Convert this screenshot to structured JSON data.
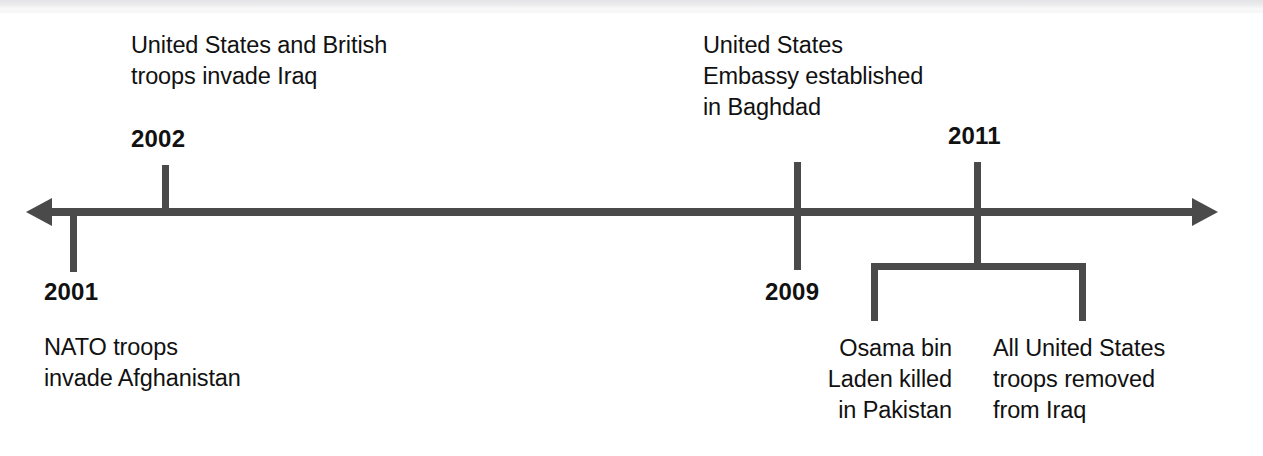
{
  "figure": {
    "kind": "historical-timeline",
    "orientation": "horizontal",
    "line_color": "#4a4a4a",
    "text_color": "#111111",
    "background": "#ffffff",
    "left_arrowhead": "arrow-left-icon",
    "right_arrowhead": "arrow-right-icon"
  },
  "events": [
    {
      "id": "e2001",
      "year": "2001",
      "description": "NATO troops\ninvade Afghanistan",
      "side": "below"
    },
    {
      "id": "e2002",
      "year": "2002",
      "description": "United States and British\ntroops invade Iraq",
      "side": "above"
    },
    {
      "id": "e2009",
      "year": "2009",
      "description": "United States\nEmbassy established\nin Baghdad",
      "side": "above"
    },
    {
      "id": "e2011",
      "year": "2011",
      "description_left": "Osama bin\nLaden killed\nin Pakistan",
      "description_right": "All United States\ntroops removed\nfrom Iraq",
      "side": "both"
    }
  ]
}
